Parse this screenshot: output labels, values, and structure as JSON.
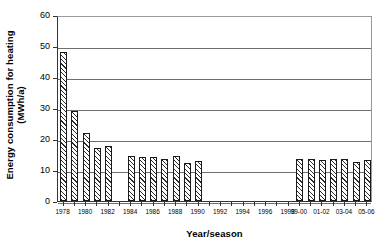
{
  "chart_data": {
    "type": "bar",
    "title": "",
    "subtitle": "",
    "xlabel": "Year/season",
    "ylabel": "Energy consumption for heating (MWh/a)",
    "ylabel_line1": "Energy consumption for heating",
    "ylabel_line2": "(MWh/a)",
    "ylim": [
      0,
      60
    ],
    "ytick_values": [
      0,
      10,
      20,
      30,
      40,
      50,
      60
    ],
    "ytick_labels": [
      "0",
      "10",
      "20",
      "30",
      "40",
      "50",
      "60"
    ],
    "grid": "horizontal",
    "legend": "none",
    "xtick_labels": [
      "1978",
      "1980",
      "1982",
      "1984",
      "1986",
      "1988",
      "1990",
      "1992",
      "1994",
      "1996",
      "1998",
      "99-00",
      "01-02",
      "03-04",
      "05-06"
    ],
    "xtick_positions": [
      0,
      2,
      4,
      6,
      8,
      10,
      12,
      14,
      16,
      18,
      20,
      21,
      23,
      25,
      27
    ],
    "categories": [
      "1978",
      "1979",
      "1980",
      "1981",
      "1982",
      "1983",
      "1984",
      "1985",
      "1986",
      "1987",
      "1988",
      "1989",
      "1990",
      "1991",
      "1992",
      "1993",
      "1994",
      "1995",
      "1996",
      "1997",
      "1998",
      "99-00",
      "00-01",
      "01-02",
      "02-03",
      "03-04",
      "04-05",
      "05-06"
    ],
    "values": [
      48.1,
      28.9,
      21.8,
      17.1,
      17.8,
      null,
      14.5,
      14.3,
      14.2,
      13.5,
      14.4,
      12.3,
      13.0,
      null,
      null,
      null,
      null,
      null,
      null,
      null,
      null,
      13.4,
      13.6,
      13.2,
      13.7,
      13.6,
      12.6,
      13.3
    ],
    "bar_color": "#ffffff",
    "bar_edge_color": "#1a1a1a",
    "bar_pattern": "diagonal-hatch",
    "gridline_color": "#6f6f6f",
    "axis_color": "#333333"
  }
}
